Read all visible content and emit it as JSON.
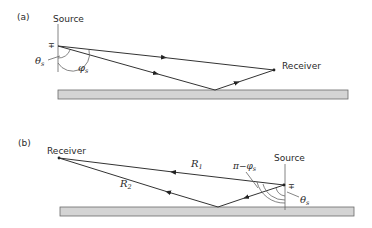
{
  "panels": [
    {
      "id": "a",
      "label": "(a)",
      "source_label": "Source",
      "receiver_label": "Receiver",
      "polarity_symbol": "∓",
      "angle_labels": {
        "theta": "θ",
        "theta_sub": "s",
        "phi": "φ",
        "phi_sub": "s"
      }
    },
    {
      "id": "b",
      "label": "(b)",
      "source_label": "Source",
      "receiver_label": "Receiver",
      "polarity_symbol": "∓",
      "path_labels": {
        "r1": "R",
        "r1_sub": "1",
        "r2": "R",
        "r2_sub": "2"
      },
      "angle_labels": {
        "pi_minus_phi": "π−φ",
        "pi_minus_phi_sub": "s",
        "theta": "θ",
        "theta_sub": "s"
      }
    }
  ],
  "colors": {
    "line": "#333333",
    "ground_fill": "#d4d4d4",
    "ground_stroke": "#6a6a6a"
  }
}
